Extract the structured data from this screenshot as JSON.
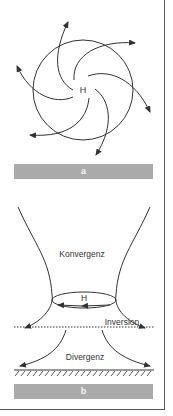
{
  "panel_a": {
    "center_label": "H",
    "caption": "a"
  },
  "panel_b": {
    "high_label": "H",
    "convergence_label": "Konvergenz",
    "inversion_label": "Inversion",
    "divergence_label": "Divergenz",
    "caption": "b"
  },
  "colors": {
    "line": "#333333",
    "caption_bar": "#aaaaaa",
    "caption_text": "#f4f4f4"
  }
}
